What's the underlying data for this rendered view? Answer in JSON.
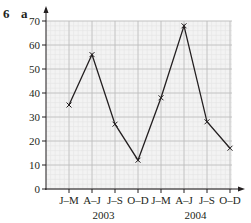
{
  "question": {
    "number": "6",
    "part": "a"
  },
  "colors": {
    "line": "#231f20",
    "grid_minor": "#e4e4e4",
    "grid_major": "#bdbdbd",
    "grid_bg": "#f3f3f3"
  },
  "chart_data": {
    "type": "line",
    "title": "",
    "xlabel": "",
    "ylabel": "",
    "categories": [
      "J–M",
      "A–J",
      "J–S",
      "O–D",
      "J–M",
      "A–J",
      "J–S",
      "O–D"
    ],
    "year_labels": [
      {
        "label": "2003",
        "span": [
          0,
          3
        ]
      },
      {
        "label": "2004",
        "span": [
          4,
          7
        ]
      }
    ],
    "series": [
      {
        "name": "value",
        "values": [
          35,
          56,
          27,
          12,
          38,
          68,
          28,
          17
        ],
        "marker": "x"
      }
    ],
    "ylim": [
      0,
      70
    ],
    "yticks": [
      0,
      10,
      20,
      30,
      40,
      50,
      60,
      70
    ],
    "grid": true,
    "legend": "none"
  }
}
